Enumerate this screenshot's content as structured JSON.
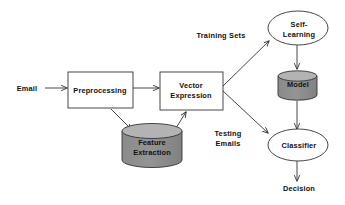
{
  "diagram": {
    "background_color": "#ffffff",
    "stroke_color": "#333333",
    "cylinder_body_color": "#8a8a8a",
    "cylinder_top_color": "#b3b3b3",
    "box_fill_color": "#ffffff",
    "ellipse_fill_color": "#ffffff",
    "nodes": {
      "email": {
        "label": "Email",
        "shape": "text"
      },
      "preprocessing": {
        "label": "Preprocessing",
        "shape": "rectangle"
      },
      "vector_expression": {
        "label": "Vector\nExpression",
        "shape": "rectangle"
      },
      "feature_extraction": {
        "label": "Feature\nExtraction",
        "shape": "cylinder"
      },
      "self_learning": {
        "label": "Self-\nLearning",
        "shape": "ellipse"
      },
      "model": {
        "label": "Model",
        "shape": "cylinder"
      },
      "classifier": {
        "label": "Classifier",
        "shape": "ellipse"
      },
      "decision": {
        "label": "Decision",
        "shape": "text"
      }
    },
    "edge_labels": {
      "training_sets": "Training Sets",
      "testing_emails": "Testing\nEmails"
    },
    "edges": [
      {
        "from": "email",
        "to": "preprocessing",
        "label": ""
      },
      {
        "from": "preprocessing",
        "to": "vector_expression",
        "label": ""
      },
      {
        "from": "preprocessing",
        "to": "feature_extraction",
        "label": ""
      },
      {
        "from": "feature_extraction",
        "to": "vector_expression",
        "label": ""
      },
      {
        "from": "vector_expression",
        "to": "self_learning",
        "label": "Training Sets"
      },
      {
        "from": "vector_expression",
        "to": "classifier",
        "label": "Testing Emails"
      },
      {
        "from": "self_learning",
        "to": "model",
        "label": ""
      },
      {
        "from": "model",
        "to": "classifier",
        "label": ""
      },
      {
        "from": "classifier",
        "to": "decision",
        "label": ""
      }
    ]
  }
}
